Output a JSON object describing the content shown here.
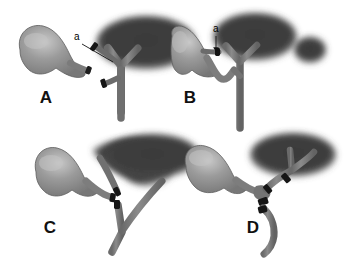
{
  "figure": {
    "background_color": "#ffffff",
    "panels": [
      {
        "id": "A",
        "letter": "A",
        "letter_x": 46,
        "letter_y": 103,
        "callout": {
          "label": "a",
          "x": 76,
          "y": 40,
          "line_to_x": 113,
          "line_to_y": 62
        },
        "description": "Gallbladder at left with cystic duct stump; transected duct segments with clips beside an intact Y-shaped hepatic duct under the dark liver shadow"
      },
      {
        "id": "B",
        "letter": "B",
        "letter_x": 190,
        "letter_y": 103,
        "callout": {
          "label": "a",
          "x": 215,
          "y": 32,
          "line_to_x": 216,
          "line_to_y": 52
        },
        "description": "Gallbladder with cystic duct joining the intact Y-shaped hepatic duct; short clipped stump indicated at the junction"
      },
      {
        "id": "C",
        "letter": "C",
        "letter_x": 50,
        "letter_y": 233,
        "callout": null,
        "description": "Gallbladder with duct transected and two clips; common hepatic duct and common bile duct separated beneath the liver shadow"
      },
      {
        "id": "D",
        "letter": "D",
        "letter_x": 253,
        "letter_y": 233,
        "callout": null,
        "description": "Gallbladder with multiple surgical clips occluding the divided hepatic and common bile ducts"
      }
    ],
    "colors": {
      "background": "#ffffff",
      "liver_shadow": "#3c3c3c",
      "gallbladder_fill": "#8d8d8d",
      "gallbladder_highlight": "#c8c8c8",
      "duct_fill": "#7e7e7e",
      "duct_shade": "#5f5f5f",
      "clip_dark": "#1d1d1d",
      "label_text": "#111111"
    }
  }
}
